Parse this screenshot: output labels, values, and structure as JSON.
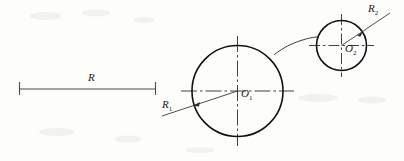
{
  "drawing": {
    "title": "Two-circle tangent arc construction",
    "background_color": "#fdfdfc",
    "line_color": "#111111",
    "centerline_color": "#2b2b2b",
    "width": 404,
    "height": 161
  },
  "labels": {
    "dimension_r": {
      "text": "R",
      "sub": ""
    },
    "radius_1": {
      "text": "R",
      "sub": "1"
    },
    "radius_2": {
      "text": "R",
      "sub": "2"
    },
    "center_1": {
      "text": "O",
      "sub": "1"
    },
    "center_2": {
      "text": "O",
      "sub": "2"
    }
  },
  "geometry": {
    "circle_large": {
      "cx": 237.5,
      "cy": 91,
      "r": 45.5
    },
    "circle_small": {
      "cx": 341.5,
      "cy": 45.5,
      "r": 25
    },
    "centermark_large": {
      "h_x1": 181,
      "h_x2": 294,
      "h_y": 91,
      "v_y1": 36,
      "v_y2": 146,
      "v_x": 237.5
    },
    "centermark_small": {
      "h_x1": 309,
      "h_x2": 374,
      "h_y": 45.5,
      "v_y1": 14,
      "v_y2": 77,
      "v_x": 341.5
    },
    "leader_1": {
      "x1": 162,
      "y1": 116,
      "x2": 237.5,
      "y2": 91,
      "arrow_x": 194,
      "arrow_y": 105.4
    },
    "leader_2": {
      "x1": 390,
      "y1": 13,
      "x2": 341.5,
      "y2": 45.5,
      "arrow_x": 362.2,
      "arrow_y": 32.1
    },
    "tangent_arc": {
      "from_x": 275,
      "from_y": 54,
      "to_x": 317,
      "to_y": 37
    },
    "dimension_line": {
      "x1": 19,
      "x2": 156,
      "y": 89,
      "tick_top": 82,
      "tick_bottom": 95
    }
  }
}
